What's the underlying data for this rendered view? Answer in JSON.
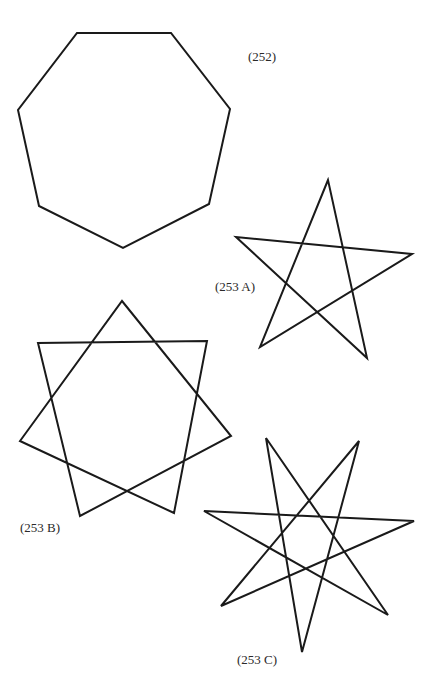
{
  "colors": {
    "stroke": "#1a1a1a",
    "text": "#2a2a2a",
    "background": "#ffffff"
  },
  "figures": [
    {
      "id": "252",
      "label": "(252)",
      "kind": "heptagon",
      "label_pos": [
        248,
        50
      ],
      "points": "77,33 171,33 230,109 209,204 123,248 39,206 18,110"
    },
    {
      "id": "253A",
      "label": "(253 A)",
      "kind": "pentagram",
      "label_pos": [
        215,
        280
      ],
      "points": "328,180 260,347 412,254 236,237 367,358"
    },
    {
      "id": "253B",
      "label": "(253 B)",
      "kind": "heptagram-7-2",
      "label_pos": [
        20,
        521
      ],
      "points": "122,301 231,436 80,516 38,343 207,341 174,513 20,441"
    },
    {
      "id": "253C",
      "label": "(253 C)",
      "kind": "heptagram-7-3",
      "label_pos": [
        237,
        653
      ],
      "points": "266,438 388,615 204,511 414,521 221,606 359,441 302,652"
    }
  ]
}
